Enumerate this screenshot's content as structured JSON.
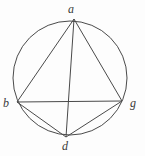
{
  "figure": {
    "kind": "geometry-diagram",
    "background_color": "#fdfdfd",
    "stroke_color": "#4a4a4a",
    "label_color": "#3a3a3a",
    "stroke_width": 1,
    "width": 145,
    "height": 156
  },
  "circle": {
    "name": "circumscribed-circle",
    "cx": 70,
    "cy": 78,
    "r": 57
  },
  "points": [
    {
      "id": "a",
      "label": "a",
      "x": 74,
      "y": 19,
      "label_x": 68,
      "label_y": 3
    },
    {
      "id": "b",
      "label": "b",
      "x": 17,
      "y": 102,
      "label_x": 3,
      "label_y": 97
    },
    {
      "id": "g",
      "label": "g",
      "x": 122,
      "y": 101,
      "label_x": 130,
      "label_y": 97
    },
    {
      "id": "d",
      "label": "d",
      "x": 66,
      "y": 137,
      "label_x": 62,
      "label_y": 140
    }
  ],
  "segments": [
    {
      "id": "ab",
      "name": "chord-a-b",
      "from": "a",
      "to": "b",
      "x1": 74,
      "y1": 19,
      "x2": 17,
      "y2": 102
    },
    {
      "id": "ag",
      "name": "chord-a-g",
      "from": "a",
      "to": "g",
      "x1": 74,
      "y1": 19,
      "x2": 122,
      "y2": 101
    },
    {
      "id": "ad",
      "name": "chord-a-d",
      "from": "a",
      "to": "d",
      "x1": 74,
      "y1": 19,
      "x2": 66,
      "y2": 137
    },
    {
      "id": "bg",
      "name": "chord-b-g",
      "from": "b",
      "to": "g",
      "x1": 17,
      "y1": 102,
      "x2": 122,
      "y2": 101
    },
    {
      "id": "bd",
      "name": "chord-b-d",
      "from": "b",
      "to": "d",
      "x1": 17,
      "y1": 102,
      "x2": 66,
      "y2": 137
    },
    {
      "id": "gd",
      "name": "chord-g-d",
      "from": "g",
      "to": "d",
      "x1": 122,
      "y1": 101,
      "x2": 66,
      "y2": 137
    }
  ],
  "labels": {
    "a": "a",
    "b": "b",
    "g": "g",
    "d": "d"
  }
}
